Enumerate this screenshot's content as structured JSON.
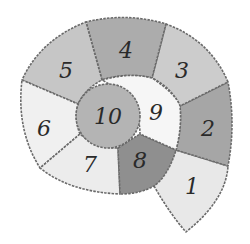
{
  "diagram": {
    "title": "",
    "type": "numbered spiral shell",
    "segments": [
      {
        "label": "1",
        "fill": "#e8e8e8"
      },
      {
        "label": "2",
        "fill": "#a6a6a6"
      },
      {
        "label": "3",
        "fill": "#cccccc"
      },
      {
        "label": "4",
        "fill": "#acacac"
      },
      {
        "label": "5",
        "fill": "#c6c6c6"
      },
      {
        "label": "6",
        "fill": "#f0f0f0"
      },
      {
        "label": "7",
        "fill": "#ececec"
      },
      {
        "label": "8",
        "fill": "#8f8f8f"
      },
      {
        "label": "9",
        "fill": "#f6f6f6"
      },
      {
        "label": "10",
        "fill": "#b4b4b4"
      }
    ]
  }
}
